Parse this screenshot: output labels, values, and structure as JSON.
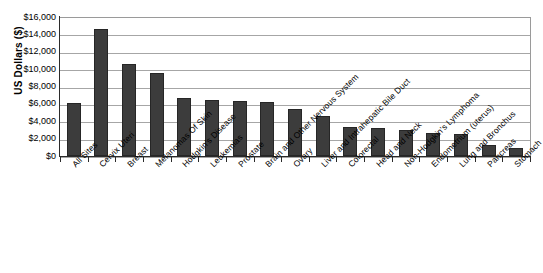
{
  "chart_data": {
    "type": "bar",
    "title": "",
    "subtitle": "",
    "xlabel": "",
    "ylabel": "US Dollars ($)",
    "ylim": [
      0,
      16000
    ],
    "ytick_step": 2000,
    "grid": true,
    "legend": false,
    "orientation": "vertical",
    "bar_color": "#3c3c3c",
    "categories": [
      "All Sites",
      "Cervix Uteri",
      "Breast",
      "Melanomas Of Skin",
      "Hodgkin's Disease",
      "Leukemias",
      "Prostate",
      "Brain and Other Nervous System",
      "Ovary",
      "Liver and Intrahepatic Bile Duct",
      "Colorectal",
      "Head and Neck",
      "Non-Hodgkin's Lymphoma",
      "Endometrium (uterus)",
      "Lung and Bronchus",
      "Pancreas",
      "Stomach"
    ],
    "values": [
      6100,
      14600,
      10600,
      9500,
      6700,
      6500,
      6300,
      6200,
      5400,
      4600,
      3300,
      3200,
      3000,
      2700,
      2500,
      1300,
      900
    ],
    "ytick_labels": [
      "$16,000",
      "$14,000",
      "$12,000",
      "$10,000",
      "$8,000",
      "$6,000",
      "$4,000",
      "$2,000",
      "$0"
    ],
    "ytick_values": [
      16000,
      14000,
      12000,
      10000,
      8000,
      6000,
      4000,
      2000,
      0
    ]
  }
}
